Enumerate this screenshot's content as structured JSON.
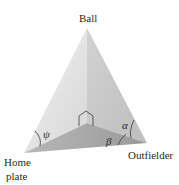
{
  "diagram": {
    "labels": {
      "ball": "Ball",
      "home_plate_line1": "Home",
      "home_plate_line2": "plate",
      "outfielder": "Outfielder"
    },
    "angles": {
      "psi": "ψ",
      "alpha": "α",
      "beta": "β"
    },
    "colors": {
      "left_face": "#e2e2e2",
      "right_face": "#c9c9c9",
      "base_face": "#a9a9a9",
      "edge": "#3a3a3a"
    }
  }
}
